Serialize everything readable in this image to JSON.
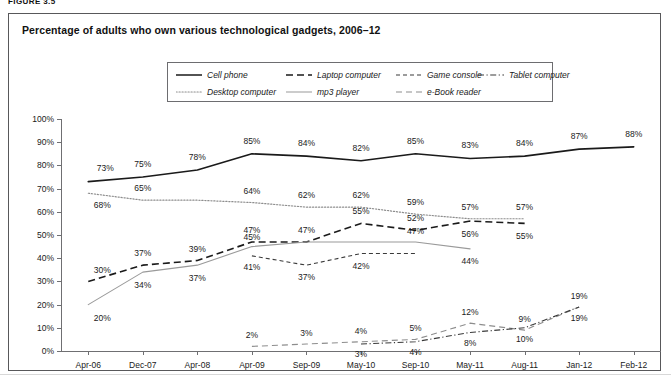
{
  "figure_label": "FIGURE 3.5",
  "chart_title": "Percentage of adults who own various technological gadgets, 2006–12",
  "legend": {
    "items": [
      {
        "label": "Cell phone",
        "style": "solid",
        "color": "#1a1a1a",
        "row": 0,
        "col": 0
      },
      {
        "label": "Laptop computer",
        "style": "dashed",
        "color": "#1a1a1a",
        "row": 0,
        "col": 1
      },
      {
        "label": "Game console",
        "style": "fine-dashed",
        "color": "#3a3a3a",
        "row": 0,
        "col": 2
      },
      {
        "label": "Tablet computer",
        "style": "dash-dot",
        "color": "#3a3a3a",
        "row": 0,
        "col": 3
      },
      {
        "label": "Desktop computer",
        "style": "dotted",
        "color": "#8d8d8d",
        "row": 1,
        "col": 0
      },
      {
        "label": "mp3 player",
        "style": "light-solid",
        "color": "#9a9a9a",
        "row": 1,
        "col": 1
      },
      {
        "label": "e-Book reader",
        "style": "long-dashed",
        "color": "#8d8d8d",
        "row": 1,
        "col": 2
      }
    ]
  },
  "chart_data": {
    "type": "line",
    "title": "Percentage of adults who own various technological gadgets, 2006–12",
    "xlabel": "",
    "ylabel": "",
    "ylim": [
      0,
      100
    ],
    "ytick_labels": [
      "100%",
      "90%",
      "80%",
      "70%",
      "60%",
      "50%",
      "40%",
      "30%",
      "20%",
      "10%",
      "0%"
    ],
    "ytick_values": [
      100,
      90,
      80,
      70,
      60,
      50,
      40,
      30,
      20,
      10,
      0
    ],
    "grid": false,
    "legend_position": "top-center",
    "categories": [
      "Apr-06",
      "Dec-07",
      "Apr-08",
      "Apr-09",
      "Sep-09",
      "May-10",
      "Sep-10",
      "May-11",
      "Aug-11",
      "Jan-12",
      "Feb-12"
    ],
    "series": [
      {
        "name": "Cell phone",
        "style": "solid",
        "color": "#1a1a1a",
        "values": [
          73,
          75,
          78,
          85,
          84,
          82,
          85,
          83,
          84,
          87,
          88
        ],
        "labels": [
          "73%",
          "75%",
          "78%",
          "85%",
          "84%",
          "82%",
          "85%",
          "83%",
          "84%",
          "87%",
          "88%"
        ]
      },
      {
        "name": "Desktop computer",
        "style": "dotted",
        "color": "#8d8d8d",
        "values": [
          68,
          65,
          65,
          64,
          62,
          62,
          59,
          57,
          57,
          null,
          null
        ],
        "labels": [
          "68%",
          "65%",
          null,
          "64%",
          "62%",
          "62%",
          "59%",
          "57%",
          "57%",
          null,
          null
        ]
      },
      {
        "name": "Laptop computer",
        "style": "dashed",
        "color": "#1a1a1a",
        "values": [
          30,
          37,
          39,
          47,
          47,
          55,
          52,
          56,
          55,
          null,
          null
        ],
        "labels": [
          "30%",
          "37%",
          "39%",
          "47%",
          "47%",
          "55%",
          "52%",
          "56%",
          "55%",
          null,
          null
        ]
      },
      {
        "name": "mp3 player",
        "style": "light-solid",
        "color": "#9a9a9a",
        "values": [
          20,
          34,
          37,
          45,
          47,
          47,
          47,
          44,
          null,
          null,
          null
        ],
        "labels": [
          "20%",
          "34%",
          "37%",
          "45%",
          null,
          null,
          "47%",
          "44%",
          null,
          null,
          null
        ]
      },
      {
        "name": "Game console",
        "style": "fine-dashed",
        "color": "#3a3a3a",
        "values": [
          null,
          null,
          null,
          41,
          37,
          42,
          42,
          null,
          null,
          null,
          null
        ],
        "labels": [
          null,
          null,
          null,
          "41%",
          "37%",
          "42%",
          null,
          null,
          null,
          null,
          null
        ]
      },
      {
        "name": "e-Book reader",
        "style": "long-dashed",
        "color": "#8d8d8d",
        "values": [
          null,
          null,
          null,
          2,
          3,
          4,
          5,
          12,
          9,
          19,
          null
        ],
        "labels": [
          null,
          null,
          null,
          "2%",
          "3%",
          "4%",
          "5%",
          "12%",
          "9%",
          "19%",
          null
        ]
      },
      {
        "name": "Tablet computer",
        "style": "dash-dot",
        "color": "#3a3a3a",
        "values": [
          null,
          null,
          null,
          null,
          null,
          3,
          4,
          8,
          10,
          19,
          null
        ],
        "labels": [
          null,
          null,
          null,
          null,
          null,
          "3%",
          "4%",
          "8%",
          "10%",
          "19%",
          null
        ]
      }
    ],
    "point_labels": [
      {
        "series": "Cell phone",
        "x": "Apr-06",
        "text": "73%",
        "px": 17,
        "py": -14
      },
      {
        "series": "Cell phone",
        "x": "Dec-07",
        "text": "75%",
        "px": 0,
        "py": -13
      },
      {
        "series": "Cell phone",
        "x": "Apr-08",
        "text": "78%",
        "px": 0,
        "py": -13
      },
      {
        "series": "Cell phone",
        "x": "Apr-09",
        "text": "85%",
        "px": 0,
        "py": -13
      },
      {
        "series": "Cell phone",
        "x": "Sep-09",
        "text": "84%",
        "px": 0,
        "py": -13
      },
      {
        "series": "Cell phone",
        "x": "May-10",
        "text": "82%",
        "px": 0,
        "py": -13
      },
      {
        "series": "Cell phone",
        "x": "Sep-10",
        "text": "85%",
        "px": 0,
        "py": -13
      },
      {
        "series": "Cell phone",
        "x": "May-11",
        "text": "83%",
        "px": 0,
        "py": -13
      },
      {
        "series": "Cell phone",
        "x": "Aug-11",
        "text": "84%",
        "px": 0,
        "py": -13
      },
      {
        "series": "Cell phone",
        "x": "Jan-12",
        "text": "87%",
        "px": 0,
        "py": -13
      },
      {
        "series": "Cell phone",
        "x": "Feb-12",
        "text": "88%",
        "px": 0,
        "py": -13
      },
      {
        "series": "Desktop computer",
        "x": "Apr-06",
        "text": "68%",
        "px": 14,
        "py": 12
      },
      {
        "series": "Desktop computer",
        "x": "Dec-07",
        "text": "65%",
        "px": 0,
        "py": -12
      },
      {
        "series": "Desktop computer",
        "x": "Apr-09",
        "text": "64%",
        "px": 0,
        "py": -12
      },
      {
        "series": "Desktop computer",
        "x": "Sep-09",
        "text": "62%",
        "px": 0,
        "py": -12
      },
      {
        "series": "Desktop computer",
        "x": "May-10",
        "text": "62%",
        "px": 0,
        "py": -12
      },
      {
        "series": "Desktop computer",
        "x": "Sep-10",
        "text": "59%",
        "px": 0,
        "py": -12
      },
      {
        "series": "Desktop computer",
        "x": "May-11",
        "text": "57%",
        "px": 0,
        "py": -12
      },
      {
        "series": "Desktop computer",
        "x": "Aug-11",
        "text": "57%",
        "px": 0,
        "py": -12
      },
      {
        "series": "Laptop computer",
        "x": "Apr-06",
        "text": "30%",
        "px": 14,
        "py": -11
      },
      {
        "series": "Laptop computer",
        "x": "Dec-07",
        "text": "37%",
        "px": 0,
        "py": -12
      },
      {
        "series": "Laptop computer",
        "x": "Apr-08",
        "text": "39%",
        "px": 0,
        "py": -12
      },
      {
        "series": "Laptop computer",
        "x": "Apr-09",
        "text": "47%",
        "px": 0,
        "py": -12
      },
      {
        "series": "Laptop computer",
        "x": "Sep-09",
        "text": "47%",
        "px": 0,
        "py": -12
      },
      {
        "series": "Laptop computer",
        "x": "May-10",
        "text": "55%",
        "px": 0,
        "py": -12
      },
      {
        "series": "Laptop computer",
        "x": "Sep-10",
        "text": "52%",
        "px": 0,
        "py": -12
      },
      {
        "series": "Laptop computer",
        "x": "May-11",
        "text": "56%",
        "px": 0,
        "py": 13
      },
      {
        "series": "Laptop computer",
        "x": "Aug-11",
        "text": "55%",
        "px": 0,
        "py": 13
      },
      {
        "series": "mp3 player",
        "x": "Apr-06",
        "text": "20%",
        "px": 14,
        "py": 13
      },
      {
        "series": "mp3 player",
        "x": "Dec-07",
        "text": "34%",
        "px": 0,
        "py": 13
      },
      {
        "series": "mp3 player",
        "x": "Apr-08",
        "text": "37%",
        "px": 0,
        "py": 13
      },
      {
        "series": "mp3 player",
        "x": "Apr-09",
        "text": "45%",
        "px": 0,
        "py": -10
      },
      {
        "series": "mp3 player",
        "x": "Sep-10",
        "text": "47%",
        "px": 0,
        "py": -11
      },
      {
        "series": "mp3 player",
        "x": "May-11",
        "text": "44%",
        "px": 0,
        "py": 12
      },
      {
        "series": "Game console",
        "x": "Apr-09",
        "text": "41%",
        "px": 0,
        "py": 11
      },
      {
        "series": "Game console",
        "x": "Sep-09",
        "text": "37%",
        "px": 0,
        "py": 12
      },
      {
        "series": "Game console",
        "x": "May-10",
        "text": "42%",
        "px": 0,
        "py": 12
      },
      {
        "series": "e-Book reader",
        "x": "Apr-09",
        "text": "2%",
        "px": 0,
        "py": -11
      },
      {
        "series": "e-Book reader",
        "x": "Sep-09",
        "text": "3%",
        "px": 0,
        "py": -11
      },
      {
        "series": "e-Book reader",
        "x": "May-10",
        "text": "4%",
        "px": 0,
        "py": -11
      },
      {
        "series": "e-Book reader",
        "x": "Sep-10",
        "text": "5%",
        "px": 0,
        "py": -11
      },
      {
        "series": "e-Book reader",
        "x": "May-11",
        "text": "12%",
        "px": 0,
        "py": -11
      },
      {
        "series": "e-Book reader",
        "x": "Aug-11",
        "text": "9%",
        "px": 0,
        "py": -11
      },
      {
        "series": "e-Book reader",
        "x": "Jan-12",
        "text": "19%",
        "px": 0,
        "py": -11
      },
      {
        "series": "Tablet computer",
        "x": "May-10",
        "text": "3%",
        "px": 0,
        "py": 10
      },
      {
        "series": "Tablet computer",
        "x": "Sep-10",
        "text": "4%",
        "px": 0,
        "py": 10
      },
      {
        "series": "Tablet computer",
        "x": "May-11",
        "text": "8%",
        "px": 0,
        "py": 11
      },
      {
        "series": "Tablet computer",
        "x": "Aug-11",
        "text": "10%",
        "px": 0,
        "py": 11
      },
      {
        "series": "Tablet computer",
        "x": "Jan-12",
        "text": "19%",
        "px": 0,
        "py": 11
      }
    ]
  }
}
